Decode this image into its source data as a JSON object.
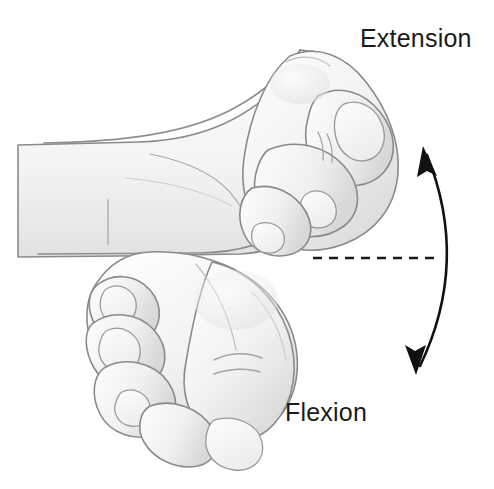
{
  "figure": {
    "background_color": "#ffffff",
    "width": 494,
    "height": 489
  },
  "labels": {
    "extension": "Extension",
    "flexion": "Flexion",
    "text_color": "#1a1a1a",
    "font_size_px": 25
  },
  "reference_line": {
    "name": "neutral-axis",
    "style": "dashed",
    "color": "#1a1a1a",
    "x_start": 313,
    "x_end": 440,
    "y": 258,
    "dash_pattern": "9 7",
    "stroke_width": 2.4
  },
  "motion_arrow": {
    "name": "range-of-motion-arrow",
    "style": "double-headed-curved",
    "color": "#111111",
    "stroke_width": 2.6,
    "top_tip": [
      424,
      148
    ],
    "bottom_tip": [
      417,
      372
    ],
    "bow_direction": "right",
    "control_point": [
      470,
      260
    ],
    "top_meaning": "Extension",
    "bottom_meaning": "Flexion"
  },
  "anatomy": {
    "skin_fill": "#fbfbfb",
    "shade_light": "#ededed",
    "shade_mid": "#dedede",
    "shade_deep": "#cfcfcf",
    "outline_color": "#8a8a8a",
    "outline_width": 1.6,
    "parts": [
      {
        "name": "upper-forearm",
        "description": "Horizontal forearm band entering from the left edge",
        "position": "left-center"
      },
      {
        "name": "upper-hand-extended",
        "description": "Closed fist angled upward showing wrist extension",
        "position": "upper-right"
      },
      {
        "name": "lower-hand-flexed",
        "description": "Closed fist angled downward showing wrist flexion",
        "position": "lower-left"
      }
    ]
  }
}
